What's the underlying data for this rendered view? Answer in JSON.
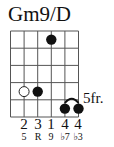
{
  "chord": {
    "name": "Gm9/D",
    "position_label": "5fr.",
    "strings": 6,
    "frets_shown": 5,
    "dots": [
      {
        "string": 4,
        "fret_row": 1,
        "type": "filled"
      },
      {
        "string": 2,
        "fret_row": 4,
        "type": "open-circle"
      },
      {
        "string": 3,
        "fret_row": 4,
        "type": "filled"
      },
      {
        "string": 5,
        "fret_row": 5,
        "type": "filled"
      },
      {
        "string": 6,
        "fret_row": 5,
        "type": "filled"
      }
    ],
    "tie": {
      "from_string": 5,
      "to_string": 6,
      "fret_row": 5
    },
    "fingers": [
      {
        "string": 2,
        "label": "2"
      },
      {
        "string": 3,
        "label": "3"
      },
      {
        "string": 4,
        "label": "1"
      },
      {
        "string": 5,
        "label": "4"
      },
      {
        "string": 6,
        "label": "4"
      }
    ],
    "intervals": [
      {
        "string": 2,
        "label": "5"
      },
      {
        "string": 3,
        "label": "R"
      },
      {
        "string": 4,
        "label": "9"
      },
      {
        "string": 5,
        "label": "♭7"
      },
      {
        "string": 6,
        "label": "♭3"
      }
    ]
  },
  "colors": {
    "ink": "#111111",
    "grid": "#555555",
    "background": "#ffffff"
  }
}
